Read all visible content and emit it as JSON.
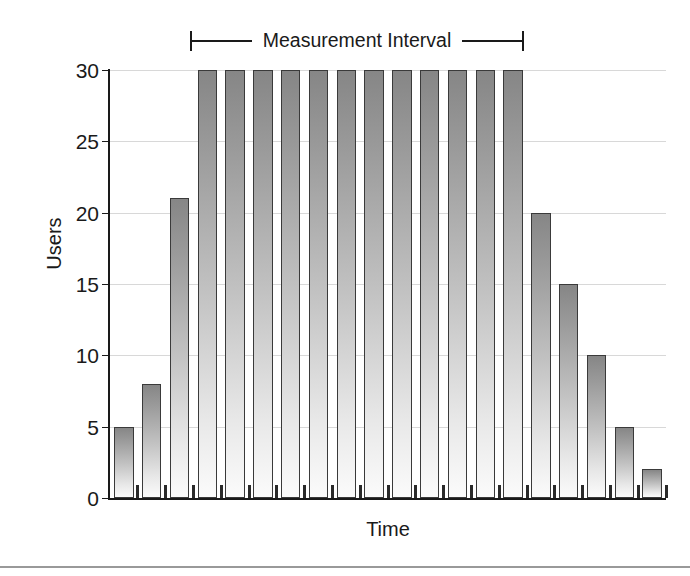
{
  "annotation": {
    "label": "Measurement Interval",
    "left_cap_icon": "bracket-left-icon",
    "right_cap_icon": "bracket-right-icon"
  },
  "chart_data": {
    "type": "bar",
    "title": "",
    "subtitle": "",
    "xlabel": "Time",
    "ylabel": "Users",
    "ylim": [
      0,
      30
    ],
    "yticks": [
      0,
      5,
      10,
      15,
      20,
      25,
      30
    ],
    "ytick_labels": [
      "0",
      "5",
      "10",
      "15",
      "20",
      "25",
      "30"
    ],
    "xticks_labeled": false,
    "grid": true,
    "grid_axis": "y",
    "legend": null,
    "bar_color": "#9a9a9a",
    "bar_edge_color": "#3a3a3a",
    "bar_fill_style": "vertical-gradient-dark-top-light-bottom",
    "categories": [
      "1",
      "2",
      "3",
      "4",
      "5",
      "6",
      "7",
      "8",
      "9",
      "10",
      "11",
      "12",
      "13",
      "14",
      "15",
      "16",
      "17",
      "18",
      "19",
      "20"
    ],
    "values": [
      5,
      8,
      21,
      30,
      30,
      30,
      30,
      30,
      30,
      30,
      30,
      30,
      30,
      30,
      30,
      20,
      15,
      10,
      5,
      2
    ],
    "annotations": [
      {
        "text": "Measurement Interval",
        "type": "span-bracket",
        "covers_categories": [
          "3",
          "16"
        ],
        "position": "above-plot"
      }
    ]
  }
}
